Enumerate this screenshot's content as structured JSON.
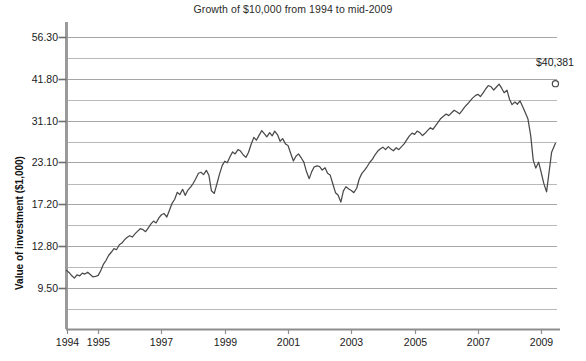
{
  "chart_data": {
    "type": "line",
    "title": "Growth of $10,000 from 1994 to mid-2009",
    "xlabel": "",
    "ylabel": "Value of investment ($1,000)",
    "yscale": "log",
    "grid": true,
    "legend": null,
    "ylim": [
      7.1,
      62.5
    ],
    "xlim": [
      1994.0,
      2009.5
    ],
    "ytick_labels": [
      "56.30",
      "41.80",
      "31.10",
      "23.10",
      "17.20",
      "12.80",
      "9.50"
    ],
    "ytick_values": [
      56.3,
      41.8,
      31.1,
      23.1,
      17.2,
      12.8,
      9.5
    ],
    "minor_gridlines": [
      48.5,
      36.0,
      26.8,
      19.9,
      14.8,
      11.0,
      8.2,
      7.1
    ],
    "xtick_labels": [
      "1994",
      "1995",
      "1997",
      "1999",
      "2001",
      "2003",
      "2005",
      "2007",
      "2009"
    ],
    "xtick_values": [
      1994,
      1995,
      1997,
      1999,
      2001,
      2003,
      2005,
      2007,
      2009
    ],
    "annotation": {
      "label": "$40,381",
      "x": 2009.45,
      "y": 40.381,
      "marker": "open-circle"
    },
    "series": [
      {
        "name": "Value of investment",
        "color": "#4a4a4a",
        "x": [
          1994.0,
          1994.08,
          1994.17,
          1994.25,
          1994.33,
          1994.42,
          1994.5,
          1994.58,
          1994.67,
          1994.75,
          1994.83,
          1994.92,
          1995.0,
          1995.08,
          1995.17,
          1995.25,
          1995.33,
          1995.42,
          1995.5,
          1995.58,
          1995.67,
          1995.75,
          1995.83,
          1995.92,
          1996.0,
          1996.08,
          1996.17,
          1996.25,
          1996.33,
          1996.42,
          1996.5,
          1996.58,
          1996.67,
          1996.75,
          1996.83,
          1996.92,
          1997.0,
          1997.08,
          1997.17,
          1997.25,
          1997.33,
          1997.42,
          1997.5,
          1997.58,
          1997.67,
          1997.75,
          1997.83,
          1997.92,
          1998.0,
          1998.08,
          1998.17,
          1998.25,
          1998.33,
          1998.42,
          1998.5,
          1998.58,
          1998.67,
          1998.75,
          1998.83,
          1998.92,
          1999.0,
          1999.08,
          1999.17,
          1999.25,
          1999.33,
          1999.42,
          1999.5,
          1999.58,
          1999.67,
          1999.75,
          1999.83,
          1999.92,
          2000.0,
          2000.08,
          2000.17,
          2000.25,
          2000.33,
          2000.42,
          2000.5,
          2000.58,
          2000.67,
          2000.75,
          2000.83,
          2000.92,
          2001.0,
          2001.08,
          2001.17,
          2001.25,
          2001.33,
          2001.42,
          2001.5,
          2001.58,
          2001.67,
          2001.75,
          2001.83,
          2001.92,
          2002.0,
          2002.08,
          2002.17,
          2002.25,
          2002.33,
          2002.42,
          2002.5,
          2002.58,
          2002.67,
          2002.75,
          2002.83,
          2002.92,
          2003.0,
          2003.08,
          2003.17,
          2003.25,
          2003.33,
          2003.42,
          2003.5,
          2003.58,
          2003.67,
          2003.75,
          2003.83,
          2003.92,
          2004.0,
          2004.08,
          2004.17,
          2004.25,
          2004.33,
          2004.42,
          2004.5,
          2004.58,
          2004.67,
          2004.75,
          2004.83,
          2004.92,
          2005.0,
          2005.08,
          2005.17,
          2005.25,
          2005.33,
          2005.42,
          2005.5,
          2005.58,
          2005.67,
          2005.75,
          2005.83,
          2005.92,
          2006.0,
          2006.08,
          2006.17,
          2006.25,
          2006.33,
          2006.42,
          2006.5,
          2006.58,
          2006.67,
          2006.75,
          2006.83,
          2006.92,
          2007.0,
          2007.08,
          2007.17,
          2007.25,
          2007.33,
          2007.42,
          2007.5,
          2007.58,
          2007.67,
          2007.75,
          2007.83,
          2007.92,
          2008.0,
          2008.08,
          2008.17,
          2008.25,
          2008.33,
          2008.42,
          2008.5,
          2008.58,
          2008.67,
          2008.75,
          2008.83,
          2008.92,
          2009.0,
          2009.08,
          2009.17,
          2009.25,
          2009.33,
          2009.45
        ],
        "y": [
          10.75,
          10.6,
          10.35,
          10.18,
          10.42,
          10.35,
          10.55,
          10.48,
          10.62,
          10.45,
          10.28,
          10.3,
          10.38,
          10.72,
          11.25,
          11.55,
          11.95,
          12.25,
          12.55,
          12.45,
          12.9,
          13.05,
          13.35,
          13.6,
          13.75,
          13.62,
          13.95,
          14.2,
          14.45,
          14.35,
          14.15,
          14.52,
          14.95,
          15.25,
          15.05,
          15.6,
          15.95,
          16.1,
          15.7,
          16.45,
          17.25,
          17.8,
          18.7,
          18.4,
          19.1,
          18.3,
          18.95,
          19.4,
          19.9,
          20.55,
          21.4,
          21.55,
          21.2,
          21.85,
          21.1,
          18.9,
          18.55,
          19.8,
          21.2,
          22.6,
          23.3,
          23.05,
          24.1,
          24.9,
          24.55,
          25.3,
          25.05,
          24.4,
          23.95,
          24.8,
          26.2,
          27.6,
          27.05,
          27.95,
          28.95,
          28.35,
          27.7,
          28.55,
          27.9,
          28.85,
          28.1,
          26.85,
          27.35,
          26.35,
          26.05,
          24.7,
          23.35,
          24.15,
          24.55,
          23.85,
          23.15,
          21.7,
          20.6,
          21.65,
          22.4,
          22.55,
          22.45,
          21.9,
          22.25,
          21.4,
          21.15,
          19.8,
          18.65,
          18.35,
          17.45,
          18.9,
          19.45,
          19.15,
          18.95,
          18.65,
          19.25,
          20.55,
          21.35,
          21.9,
          22.45,
          23.1,
          23.65,
          24.4,
          25.0,
          25.45,
          25.75,
          25.3,
          25.85,
          25.4,
          25.1,
          25.65,
          25.3,
          25.8,
          26.35,
          27.1,
          27.85,
          28.45,
          28.2,
          28.85,
          28.5,
          27.95,
          28.4,
          29.05,
          29.55,
          29.2,
          30.05,
          30.8,
          31.55,
          32.1,
          32.55,
          32.2,
          32.85,
          33.45,
          33.1,
          32.6,
          33.35,
          34.2,
          34.95,
          35.7,
          36.45,
          37.1,
          37.45,
          36.85,
          37.9,
          38.95,
          39.85,
          39.5,
          38.6,
          39.35,
          40.25,
          39.1,
          37.85,
          38.55,
          36.15,
          34.8,
          35.45,
          34.9,
          35.75,
          34.2,
          32.85,
          31.5,
          27.9,
          23.45,
          22.2,
          23.15,
          21.55,
          19.95,
          18.75,
          21.6,
          24.85,
          26.45
        ]
      }
    ]
  },
  "axes": {
    "y_title": "Value of investment ($1,000)",
    "tick_marker_shape": "open-circle"
  }
}
